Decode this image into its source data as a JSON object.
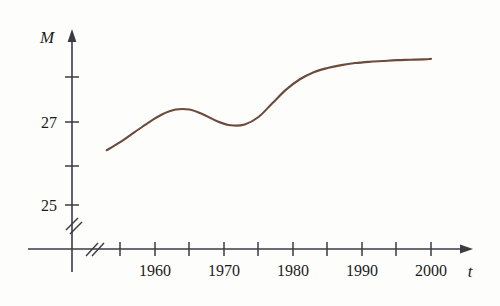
{
  "chart_data": {
    "type": "line",
    "title": "",
    "xlabel": "t",
    "ylabel": "M",
    "xlim": [
      1953,
      2002
    ],
    "ylim": [
      24.2,
      28.9
    ],
    "grid": false,
    "legend": null,
    "axis_break_x": true,
    "axis_break_y": true,
    "x_tick_values": [
      1955,
      1960,
      1965,
      1970,
      1975,
      1980,
      1985,
      1990,
      1995,
      2000
    ],
    "x_tick_labels": [
      "",
      "1960",
      "",
      "1970",
      "",
      "1980",
      "",
      "1990",
      "",
      "2000"
    ],
    "y_tick_values": [
      25,
      26,
      27,
      28
    ],
    "y_tick_labels": [
      "25",
      "",
      "27",
      ""
    ],
    "series": [
      {
        "name": "M",
        "color": "#6d4b3c",
        "x": [
          1953,
          1955,
          1957,
          1959,
          1961,
          1963,
          1965,
          1967,
          1969,
          1971,
          1973,
          1975,
          1977,
          1979,
          1981,
          1983,
          1985,
          1987,
          1989,
          1991,
          1993,
          1995,
          1997,
          1999,
          2000
        ],
        "y": [
          26.32,
          26.52,
          26.75,
          26.98,
          27.18,
          27.3,
          27.3,
          27.18,
          27.02,
          26.92,
          26.94,
          27.12,
          27.45,
          27.78,
          28.03,
          28.2,
          28.3,
          28.37,
          28.42,
          28.45,
          28.47,
          28.49,
          28.5,
          28.51,
          28.52
        ]
      }
    ]
  },
  "axis_labels": {
    "y_axis_name": "M",
    "x_axis_name": "t"
  }
}
